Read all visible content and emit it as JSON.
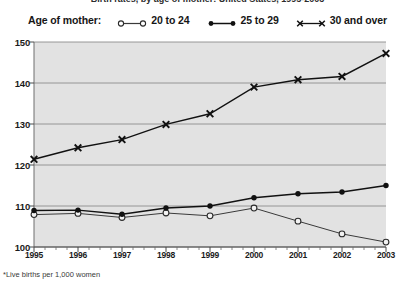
{
  "title": {
    "text": "Birth rates, by age of mother: United States, 1995-2003",
    "clipped": true
  },
  "legend": {
    "title": "Age of mother:",
    "entries": [
      {
        "label": "20 to 24",
        "marker": "open-circle-icon",
        "color": "#3a3a3a"
      },
      {
        "label": "25 to 29",
        "marker": "filled-circle-icon",
        "color": "#111111"
      },
      {
        "label": "30 and over",
        "marker": "x-cross-icon",
        "color": "#111111"
      }
    ]
  },
  "axes": {
    "y_ticks": [
      "150",
      "140",
      "130",
      "120",
      "110",
      "100"
    ],
    "x_ticks": [
      "1995",
      "1996",
      "1997",
      "1998",
      "1999",
      "2000",
      "2001",
      "2002",
      "2003"
    ]
  },
  "footnote": "*Live births per 1,000 women",
  "colors": {
    "plot_background": "#e2e2e2",
    "gridline": "#8c8c8c",
    "axis": "#4a4a4a",
    "series_20_24": "#3a3a3a",
    "series_25_29": "#111111",
    "series_30_over": "#111111"
  },
  "chart_data": {
    "type": "line",
    "title": "Birth rates, by age of mother: United States, 1995-2003",
    "xlabel": "",
    "ylabel": "",
    "ylim": [
      100,
      150
    ],
    "xlim": [
      1995,
      2003
    ],
    "grid": true,
    "legend_position": "top",
    "x": [
      1995,
      1996,
      1997,
      1998,
      1999,
      2000,
      2001,
      2002,
      2003
    ],
    "categories": [
      "1995",
      "1996",
      "1997",
      "1998",
      "1999",
      "2000",
      "2001",
      "2002",
      "2003"
    ],
    "series": [
      {
        "name": "20 to 24",
        "marker": "open-circle",
        "values": [
          107.9,
          108.2,
          107.2,
          108.3,
          107.6,
          109.5,
          106.3,
          103.2,
          101.2
        ]
      },
      {
        "name": "25 to 29",
        "marker": "filled-circle",
        "values": [
          108.9,
          109.0,
          108.0,
          109.5,
          110.0,
          112.0,
          113.0,
          113.4,
          115.0
        ]
      },
      {
        "name": "30 and over",
        "marker": "x-cross",
        "values": [
          121.4,
          124.2,
          126.2,
          129.9,
          132.5,
          139.0,
          140.8,
          141.6,
          147.2
        ]
      }
    ],
    "footnote": "*Live births per 1,000 women"
  }
}
